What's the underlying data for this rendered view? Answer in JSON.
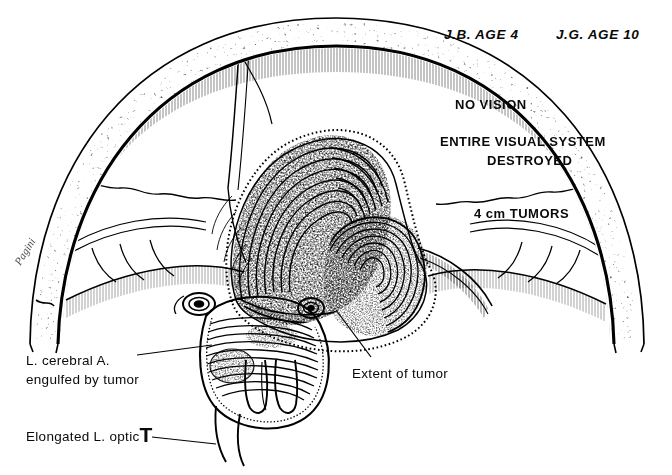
{
  "figure": {
    "background_color": "#ffffff",
    "ink_color": "#000000"
  },
  "headers": [
    {
      "id": "case-left",
      "text": "J.B. AGE 4",
      "x": 444,
      "y": 28
    },
    {
      "id": "case-right",
      "text": "J.G. AGE 10",
      "x": 556,
      "y": 28
    }
  ],
  "statements": [
    {
      "id": "no-vision",
      "text": "NO VISION",
      "x": 455,
      "y": 98,
      "align": "left"
    },
    {
      "id": "visual-system-1",
      "text": "ENTIRE VISUAL SYSTEM",
      "x": 440,
      "y": 135,
      "align": "left"
    },
    {
      "id": "visual-system-2",
      "text": "DESTROYED",
      "x": 487,
      "y": 154,
      "align": "left"
    },
    {
      "id": "tumor-size",
      "text": "4 cm TUMORS",
      "x": 474,
      "y": 207,
      "align": "left"
    }
  ],
  "annotations": [
    {
      "id": "cerebral-artery",
      "line1": "L. cerebral A.",
      "line2": "engulfed by tumor",
      "x": 26,
      "y": 354
    },
    {
      "id": "extent-of-tumor",
      "line1": "Extent of tumor",
      "x": 352,
      "y": 367
    },
    {
      "id": "optic-tract",
      "line1": "Elongated L. optic",
      "suffix": "T",
      "x": 26,
      "y": 424
    }
  ],
  "signature": {
    "id": "artist-signature",
    "text": "Pagini",
    "x": 22,
    "y": 255
  },
  "anatomy_parts": [
    "skull-outer-table",
    "skull-inner-table",
    "diploe-stipple",
    "falx-cerebri",
    "cerebral-hemispheres",
    "tentorium",
    "left-optic-tumor-mass",
    "right-optic-tumor-nodule",
    "chiasm-region",
    "brainstem-pons",
    "elongated-optic-nerve",
    "left-cerebral-artery"
  ]
}
